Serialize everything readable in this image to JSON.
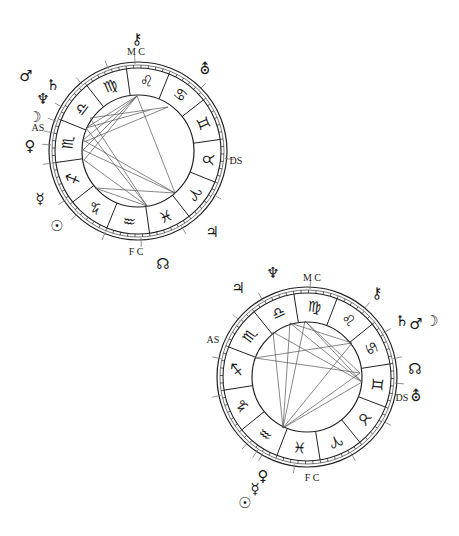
{
  "page": {
    "width": 459,
    "height": 536,
    "background": "#ffffff",
    "line_color": "#222222",
    "aspect_color": "#555555"
  },
  "charts": [
    {
      "id": "chart-1",
      "center": [
        138,
        151
      ],
      "r_outer": 89,
      "r_band": 83,
      "r_inner": 56,
      "sign_start_angle": 68,
      "first_sign_index": 4,
      "signs": [
        "♈",
        "♉",
        "♊",
        "♋",
        "♌",
        "♍",
        "♎",
        "♏",
        "♐",
        "♑",
        "♒",
        "♓"
      ],
      "sign_names": [
        "Aries",
        "Taurus",
        "Gemini",
        "Cancer",
        "Leo",
        "Virgo",
        "Libra",
        "Scorpio",
        "Sagittarius",
        "Capricorn",
        "Aquarius",
        "Pisces"
      ],
      "axis_labels": [
        {
          "text": "M C",
          "x": 136,
          "y": 55,
          "name": "mc-label"
        },
        {
          "text": "AS",
          "x": 38,
          "y": 131,
          "name": "ascendant-label"
        },
        {
          "text": "DS",
          "x": 236,
          "y": 164,
          "name": "descendant-label"
        },
        {
          "text": "F C",
          "x": 136,
          "y": 255,
          "name": "ic-label"
        }
      ],
      "tick_angles": [
        92,
        150,
        160,
        168,
        176,
        188,
        214,
        226,
        248,
        272,
        300,
        330,
        355,
        45,
        110,
        130
      ],
      "planets": [
        {
          "glyph": "⚷",
          "name": "chiron",
          "x": 137,
          "y": 44
        },
        {
          "glyph": "⛢",
          "name": "uranus",
          "x": 205,
          "y": 74
        },
        {
          "glyph": "♂",
          "name": "mars",
          "x": 26,
          "y": 81
        },
        {
          "glyph": "♄",
          "name": "saturn",
          "x": 53,
          "y": 90
        },
        {
          "glyph": "♆",
          "name": "neptune",
          "x": 43,
          "y": 104
        },
        {
          "glyph": "☽",
          "name": "moon",
          "x": 35,
          "y": 122
        },
        {
          "glyph": "♀",
          "name": "venus",
          "x": 30,
          "y": 151
        },
        {
          "glyph": "☿",
          "name": "mercury",
          "x": 40,
          "y": 204
        },
        {
          "glyph": "☉",
          "name": "sun",
          "x": 57,
          "y": 231
        },
        {
          "glyph": "♃",
          "name": "jupiter",
          "x": 212,
          "y": 237
        },
        {
          "glyph": "☊",
          "name": "north-node",
          "x": 163,
          "y": 269
        }
      ],
      "aspects": [
        [
          [
            137,
            96
          ],
          [
            83,
            140
          ]
        ],
        [
          [
            137,
            96
          ],
          [
            84,
            160
          ]
        ],
        [
          [
            137,
            96
          ],
          [
            86,
            128
          ]
        ],
        [
          [
            137,
            96
          ],
          [
            175,
            193
          ]
        ],
        [
          [
            137,
            96
          ],
          [
            83,
            150
          ]
        ],
        [
          [
            168,
            107
          ],
          [
            84,
            142
          ]
        ],
        [
          [
            168,
            107
          ],
          [
            90,
            118
          ]
        ],
        [
          [
            90,
            118
          ],
          [
            147,
            206
          ]
        ],
        [
          [
            86,
            128
          ],
          [
            147,
            206
          ]
        ],
        [
          [
            83,
            140
          ],
          [
            175,
            193
          ]
        ],
        [
          [
            84,
            160
          ],
          [
            147,
            206
          ]
        ],
        [
          [
            83,
            150
          ],
          [
            175,
            193
          ]
        ],
        [
          [
            95,
            188
          ],
          [
            175,
            193
          ]
        ],
        [
          [
            95,
            188
          ],
          [
            147,
            206
          ]
        ],
        [
          [
            86,
            128
          ],
          [
            150,
            110
          ]
        ]
      ]
    },
    {
      "id": "chart-2",
      "center": [
        307,
        377
      ],
      "r_outer": 90,
      "r_band": 84,
      "r_inner": 55,
      "sign_start_angle": 69,
      "first_sign_index": 5,
      "signs": [
        "♈",
        "♉",
        "♊",
        "♋",
        "♌",
        "♍",
        "♎",
        "♏",
        "♐",
        "♑",
        "♒",
        "♓"
      ],
      "sign_names": [
        "Aries",
        "Taurus",
        "Gemini",
        "Cancer",
        "Leo",
        "Virgo",
        "Libra",
        "Scorpio",
        "Sagittarius",
        "Capricorn",
        "Aquarius",
        "Pisces"
      ],
      "axis_labels": [
        {
          "text": "M C",
          "x": 312,
          "y": 281,
          "name": "mc-label"
        },
        {
          "text": "AS",
          "x": 213,
          "y": 343,
          "name": "ascendant-label"
        },
        {
          "text": "DS",
          "x": 402,
          "y": 401,
          "name": "descendant-label"
        },
        {
          "text": "F C",
          "x": 312,
          "y": 481,
          "name": "ic-label"
        }
      ],
      "tick_angles": [
        88,
        120,
        140,
        168,
        192,
        228,
        236,
        240,
        262,
        300,
        330,
        356,
        12,
        30,
        50
      ],
      "planets": [
        {
          "glyph": "♆",
          "name": "neptune",
          "x": 273,
          "y": 278
        },
        {
          "glyph": "♃",
          "name": "jupiter",
          "x": 238,
          "y": 293
        },
        {
          "glyph": "⚷",
          "name": "chiron",
          "x": 377,
          "y": 298
        },
        {
          "glyph": "♄",
          "name": "saturn",
          "x": 402,
          "y": 326
        },
        {
          "glyph": "♂",
          "name": "mars",
          "x": 416,
          "y": 329
        },
        {
          "glyph": "☽",
          "name": "moon",
          "x": 432,
          "y": 326
        },
        {
          "glyph": "☊",
          "name": "north-node",
          "x": 415,
          "y": 374
        },
        {
          "glyph": "⛢",
          "name": "uranus",
          "x": 416,
          "y": 401
        },
        {
          "glyph": "♀",
          "name": "venus",
          "x": 263,
          "y": 481
        },
        {
          "glyph": "☿",
          "name": "mercury",
          "x": 255,
          "y": 494
        },
        {
          "glyph": "☉",
          "name": "sun",
          "x": 245,
          "y": 508
        }
      ],
      "aspects": [
        [
          [
            283,
            428
          ],
          [
            273,
            332
          ]
        ],
        [
          [
            283,
            428
          ],
          [
            290,
            323
          ]
        ],
        [
          [
            283,
            428
          ],
          [
            305,
            321
          ]
        ],
        [
          [
            283,
            428
          ],
          [
            352,
            343
          ]
        ],
        [
          [
            283,
            428
          ],
          [
            360,
            373
          ]
        ],
        [
          [
            283,
            428
          ],
          [
            362,
            382
          ]
        ],
        [
          [
            255,
            358
          ],
          [
            352,
            343
          ]
        ],
        [
          [
            255,
            358
          ],
          [
            360,
            373
          ]
        ],
        [
          [
            273,
            332
          ],
          [
            362,
            382
          ]
        ],
        [
          [
            290,
            323
          ],
          [
            362,
            382
          ]
        ],
        [
          [
            305,
            321
          ],
          [
            360,
            373
          ]
        ],
        [
          [
            290,
            323
          ],
          [
            352,
            343
          ]
        ],
        [
          [
            305,
            321
          ],
          [
            362,
            382
          ]
        ]
      ]
    }
  ]
}
